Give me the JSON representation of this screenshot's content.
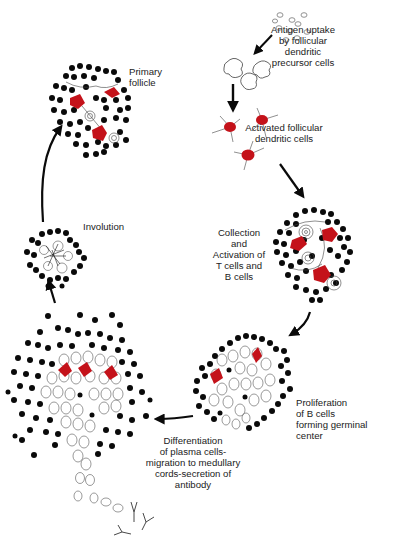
{
  "diagram": {
    "type": "cycle",
    "title": "",
    "colors": {
      "ink": "#0a0a0a",
      "fdc_red": "#d10f14",
      "outline": "#555555",
      "background": "#ffffff"
    },
    "stages": [
      {
        "id": "antigen-uptake",
        "label": "Antigen uptake\nby follicular\ndendritic\nprecursor cells"
      },
      {
        "id": "activated-fdc",
        "label": "Activated follicular\ndendritic cells"
      },
      {
        "id": "collection-activation",
        "label": "Collection\nand\nActivation of\nT cells and\nB cells"
      },
      {
        "id": "proliferation",
        "label": "Proliferation\nof B cells\nforming germinal\ncenter"
      },
      {
        "id": "differentiation",
        "label": "Differentiation\nof plasma cells-\nmigration to medullary\ncords-secretion of\nantibody"
      },
      {
        "id": "involution",
        "label": "Involution"
      },
      {
        "id": "primary-follicle",
        "label": "Primary\nfollicle"
      }
    ],
    "arrows": [
      {
        "from": "antigen",
        "to": "fdc-precursors"
      },
      {
        "from": "fdc-precursors",
        "to": "activated-fdc"
      },
      {
        "from": "activated-fdc",
        "to": "collection-activation"
      },
      {
        "from": "collection-activation",
        "to": "proliferation"
      },
      {
        "from": "proliferation",
        "to": "differentiation"
      },
      {
        "from": "differentiation",
        "to": "involution"
      },
      {
        "from": "involution",
        "to": "primary-follicle"
      }
    ]
  }
}
